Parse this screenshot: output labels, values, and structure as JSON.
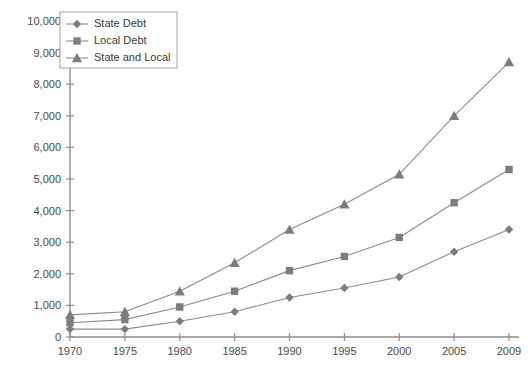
{
  "chart_data": {
    "type": "line",
    "title": "",
    "xlabel": "",
    "ylabel": "",
    "x": [
      1970,
      1975,
      1980,
      1985,
      1990,
      1995,
      2000,
      2005,
      2009
    ],
    "categories": [
      "1970",
      "1975",
      "1980",
      "1985",
      "1990",
      "1995",
      "2000",
      "2005",
      "2009"
    ],
    "xlim": [
      1970,
      2009
    ],
    "ylim": [
      0,
      10000
    ],
    "ytick_values": [
      0,
      1000,
      2000,
      3000,
      4000,
      5000,
      6000,
      7000,
      8000,
      9000,
      10000
    ],
    "ytick_labels": [
      "0",
      "1,000",
      "2,000",
      "3,000",
      "4,000",
      "5,000",
      "6,000",
      "7,000",
      "8,000",
      "9,000",
      "10,000"
    ],
    "grid": false,
    "legend_position": "top-left",
    "series": [
      {
        "name": "State Debt",
        "marker": "diamond",
        "color": "#7c7c7c",
        "values": [
          250,
          250,
          500,
          800,
          1250,
          1550,
          1900,
          2700,
          3400
        ]
      },
      {
        "name": "Local Debt",
        "marker": "square",
        "color": "#7c7c7c",
        "values": [
          450,
          550,
          950,
          1450,
          2100,
          2550,
          3150,
          4250,
          5300
        ]
      },
      {
        "name": "State and Local",
        "marker": "triangle",
        "color": "#7c7c7c",
        "values": [
          700,
          800,
          1450,
          2350,
          3400,
          4200,
          5150,
          7000,
          8700
        ]
      }
    ]
  },
  "caption": {
    "text": ""
  },
  "colors": {
    "axis": "#8d8d8d",
    "marker": "#7c7c7c",
    "line": "#8a8a8a",
    "text": "#3a3a3a",
    "background": "#ffffff"
  }
}
